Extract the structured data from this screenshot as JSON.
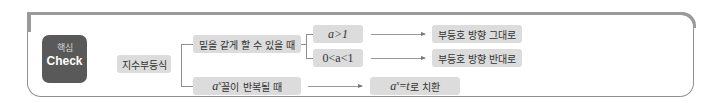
{
  "badge": {
    "korean": "핵심",
    "english": "Check"
  },
  "root": {
    "label": "지수부등식"
  },
  "branches": [
    {
      "label": "밑을 같게 할 수 있을 때",
      "cases": [
        {
          "condition": "a>1",
          "result": "부등호 방향 그대로"
        },
        {
          "condition": "0<a<1",
          "result": "부등호 방향 반대로"
        }
      ]
    },
    {
      "label_math": "a",
      "label_sup": "x",
      "label_text": " 꼴이 반복될 때",
      "result_math": "a",
      "result_sup": "x",
      "result_eq": "=",
      "result_var": "t",
      "result_text": "로 치환"
    }
  ],
  "colors": {
    "badge_bg": "#595959",
    "box_bg": "#dcdcdc",
    "frame": "#8f8f8f"
  }
}
